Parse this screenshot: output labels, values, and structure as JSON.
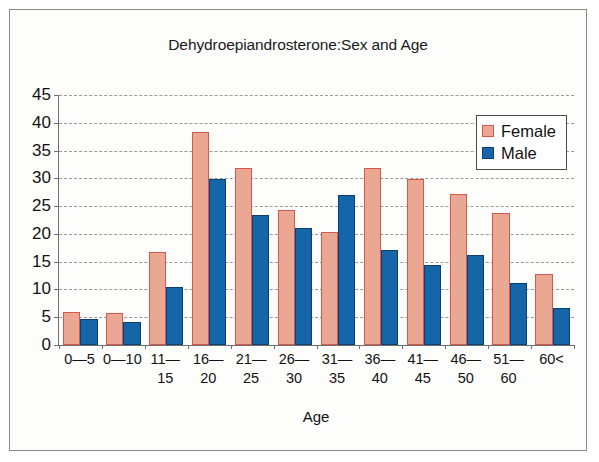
{
  "chart_data": {
    "type": "bar",
    "title": "Dehydroepiandrosterone:Sex and Age",
    "xlabel": "Age",
    "ylabel": "",
    "ylim": [
      0,
      45
    ],
    "yticks": [
      0,
      5,
      10,
      15,
      20,
      25,
      30,
      35,
      40,
      45
    ],
    "grid": true,
    "legend_position": "top-right",
    "categories": [
      "0—5",
      "0—10",
      "11—15",
      "16—20",
      "21—25",
      "26—30",
      "31—35",
      "36—40",
      "41—45",
      "46—50",
      "51—60",
      "60<"
    ],
    "category_lines": [
      [
        "0—5",
        ""
      ],
      [
        "0—10",
        ""
      ],
      [
        "11—",
        "15"
      ],
      [
        "16—",
        "20"
      ],
      [
        "21—",
        "25"
      ],
      [
        "26—",
        "30"
      ],
      [
        "31—",
        "35"
      ],
      [
        "36—",
        "40"
      ],
      [
        "41—",
        "45"
      ],
      [
        "46—",
        "50"
      ],
      [
        "51—",
        "60"
      ],
      [
        "60<",
        ""
      ]
    ],
    "series": [
      {
        "name": "Female",
        "color": "#eaa894",
        "border_color": "#d4594a",
        "values": [
          6.0,
          5.8,
          16.8,
          38.4,
          31.8,
          24.3,
          20.4,
          31.8,
          29.8,
          27.2,
          23.8,
          12.7
        ]
      },
      {
        "name": "Male",
        "color": "#1566a9",
        "border_color": "#0c3f72",
        "values": [
          4.7,
          4.2,
          10.4,
          29.9,
          23.4,
          21.0,
          27.0,
          17.1,
          14.4,
          16.2,
          11.2,
          6.6
        ]
      }
    ]
  },
  "legend": {
    "entries": [
      {
        "label": "Female"
      },
      {
        "label": "Male"
      }
    ]
  },
  "colors": {
    "female_fill": "#eaa894",
    "female_border": "#d4594a",
    "male_fill": "#1566a9",
    "male_border": "#0c3f72",
    "grid": "#9a9a9a",
    "axis": "#6f6f6f",
    "text": "#121212"
  }
}
